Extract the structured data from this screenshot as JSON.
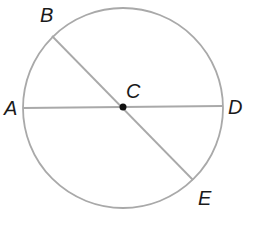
{
  "diagram": {
    "colors": {
      "stroke": "#a9a9a9",
      "label": "#1a1a1a",
      "center_point": "#111111",
      "background": "#ffffff"
    },
    "circle": {
      "center_label": "C",
      "cx": 123,
      "cy": 108,
      "r": 100
    },
    "points": [
      {
        "label": "A",
        "x": 23,
        "y": 108
      },
      {
        "label": "B",
        "x": 52,
        "y": 36
      },
      {
        "label": "C",
        "x": 123,
        "y": 108
      },
      {
        "label": "D",
        "x": 222,
        "y": 106
      },
      {
        "label": "E",
        "x": 193,
        "y": 180
      }
    ],
    "segments": [
      {
        "name": "AD",
        "from": "A",
        "to": "D"
      },
      {
        "name": "BE",
        "from": "B",
        "to": "E"
      }
    ],
    "labels": {
      "A": "A",
      "B": "B",
      "C": "C",
      "D": "D",
      "E": "E"
    }
  }
}
